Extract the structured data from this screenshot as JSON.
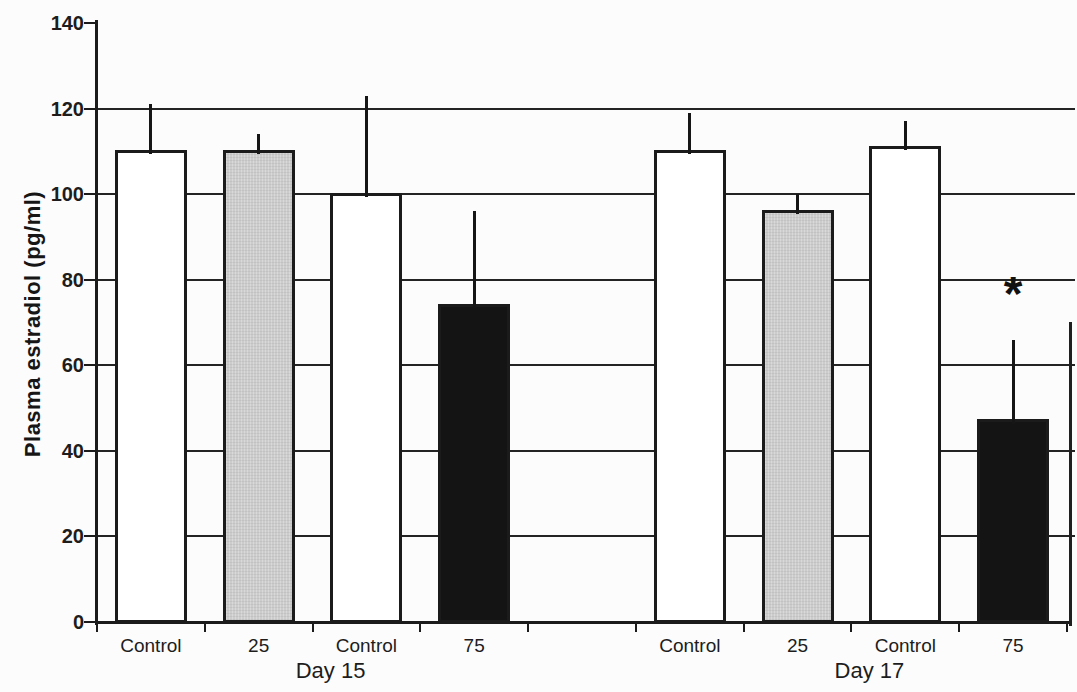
{
  "chart_data": {
    "type": "bar",
    "title": "",
    "ylabel": "Plasma estradiol (pg/ml)",
    "xlabel": "",
    "ylim": [
      0,
      140
    ],
    "yticks": [
      0,
      20,
      40,
      60,
      80,
      100,
      120,
      140
    ],
    "grid": "horizontal gridlines at every 20 units, behind bars",
    "legend": "none",
    "error_bars": "upper-only vertical lines, no caps",
    "ink_color": "#1b1b1b",
    "bar_fill_colors": {
      "white": "#ffffff",
      "gray": "#cccccc",
      "black": "#141414"
    },
    "groups": [
      {
        "label": "Day 15",
        "bars": [
          {
            "label": "Control",
            "value": 110,
            "upper_whisker": 121,
            "fill": "white"
          },
          {
            "label": "25",
            "value": 110,
            "upper_whisker": 114,
            "fill": "gray"
          },
          {
            "label": "Control",
            "value": 100,
            "upper_whisker": 123,
            "fill": "white"
          },
          {
            "label": "75",
            "value": 74,
            "upper_whisker": 96,
            "fill": "black"
          }
        ]
      },
      {
        "label": "Day 17",
        "bars": [
          {
            "label": "Control",
            "value": 110,
            "upper_whisker": 119,
            "fill": "white"
          },
          {
            "label": "25",
            "value": 96,
            "upper_whisker": 100,
            "fill": "gray"
          },
          {
            "label": "Control",
            "value": 111,
            "upper_whisker": 117,
            "fill": "white"
          },
          {
            "label": "75",
            "value": 47,
            "upper_whisker": 66,
            "fill": "black",
            "annotation": "*"
          }
        ]
      }
    ]
  }
}
